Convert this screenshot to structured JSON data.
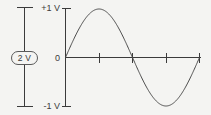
{
  "figure": {
    "background_color": "#f4f4f2",
    "line_color": "#3b3b3b",
    "curve_color": "#4a4a4a"
  },
  "amplitude_annotation": {
    "label": "2 V",
    "description": "peak-to-peak dimension bar"
  },
  "axis": {
    "y_top_label": "+1 V",
    "y_zero_label": "0",
    "y_bottom_label": "-1 V"
  },
  "chart_data": {
    "type": "line",
    "title": "",
    "xlabel": "",
    "ylabel": "",
    "ylim": [
      -1,
      1
    ],
    "xlim": [
      0,
      1
    ],
    "grid": false,
    "legend": "none",
    "y_ticks": [
      1,
      0,
      -1
    ],
    "y_tick_labels": [
      "+1 V",
      "0",
      "-1 V"
    ],
    "x_ticks": [
      0.25,
      0.5,
      0.75,
      1.0
    ],
    "x_tick_labels": [
      "",
      "",
      "",
      ""
    ],
    "peak_to_peak_volts": 2,
    "amplitude_volts": 1,
    "cycles": 1,
    "series": [
      {
        "name": "sine",
        "x": [
          0,
          0.0625,
          0.125,
          0.1875,
          0.25,
          0.3125,
          0.375,
          0.4375,
          0.5,
          0.5625,
          0.625,
          0.6875,
          0.75,
          0.8125,
          0.875,
          0.9375,
          1.0
        ],
        "values": [
          0,
          0.383,
          0.707,
          0.924,
          1.0,
          0.924,
          0.707,
          0.383,
          0,
          -0.383,
          -0.707,
          -0.924,
          -1.0,
          -0.924,
          -0.707,
          -0.383,
          0
        ]
      }
    ],
    "annotations": [
      "2 V"
    ]
  }
}
